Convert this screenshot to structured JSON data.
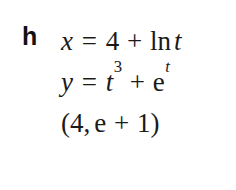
{
  "problem": {
    "item_label": "h",
    "lines": [
      {
        "name": "equation-x",
        "lhs": "x",
        "relation": "=",
        "terms": [
          "4",
          "+",
          "ln",
          "t"
        ],
        "plain_text": "x = 4 + ln t"
      },
      {
        "name": "equation-y",
        "lhs": "y",
        "relation": "=",
        "base1": "t",
        "exponent1": "3",
        "operator": "+",
        "base2": "e",
        "exponent2": "t",
        "plain_text": "y = t^3 + e^t"
      },
      {
        "name": "point-coordinates",
        "open_paren": "(",
        "x_value": "4",
        "separator": ",",
        "y_term1": "e",
        "y_operator": "+",
        "y_term2": "1",
        "close_paren": ")",
        "plain_text": "(4, e + 1)"
      }
    ]
  },
  "style": {
    "background_color": "#ffffff",
    "text_color": "#1a1a1a",
    "label_color": "#111111"
  }
}
